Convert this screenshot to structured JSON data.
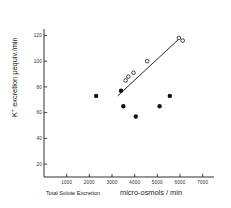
{
  "chart_data": {
    "type": "scatter",
    "title": "",
    "xlabel": "Total Solute Excretion   micro-osmols / min",
    "xlabel_part1": "Total Solute Excretion",
    "xlabel_part2": "micro-osmols / min",
    "ylabel": "K+ excretion µequiv./min",
    "ylabel_prefix": "K",
    "ylabel_superscript": "+",
    "ylabel_rest": " excretion µequiv./min",
    "xlim": [
      0,
      7500
    ],
    "ylim": [
      10,
      125
    ],
    "xticks": [
      1000,
      2000,
      3000,
      4000,
      5000,
      6000,
      7000
    ],
    "xticklabels": [
      "1000",
      "2000",
      "3000",
      "4000",
      "5000",
      "6000",
      "7000"
    ],
    "yticks": [
      20,
      40,
      60,
      80,
      100,
      120
    ],
    "yticklabels": [
      "20",
      "40",
      "60",
      "80",
      "100",
      "120"
    ],
    "grid": false,
    "legend": "none",
    "series": [
      {
        "name": "filled-circles",
        "marker": "filled-circle",
        "color": "#111111",
        "points": [
          {
            "x": 2300,
            "y": 73
          },
          {
            "x": 3400,
            "y": 77
          },
          {
            "x": 3500,
            "y": 65
          },
          {
            "x": 4050,
            "y": 57
          },
          {
            "x": 5100,
            "y": 65
          },
          {
            "x": 5550,
            "y": 73
          }
        ]
      },
      {
        "name": "open-circles",
        "marker": "open-circle",
        "color": "#111111",
        "points": [
          {
            "x": 3600,
            "y": 85
          },
          {
            "x": 3720,
            "y": 88
          },
          {
            "x": 3950,
            "y": 91
          },
          {
            "x": 4550,
            "y": 100
          },
          {
            "x": 5950,
            "y": 118
          },
          {
            "x": 6120,
            "y": 116
          }
        ]
      }
    ],
    "trendline": {
      "name": "regression-line",
      "x0": 3250,
      "y0": 73,
      "x1": 6000,
      "y1": 118,
      "color": "#111111"
    }
  }
}
